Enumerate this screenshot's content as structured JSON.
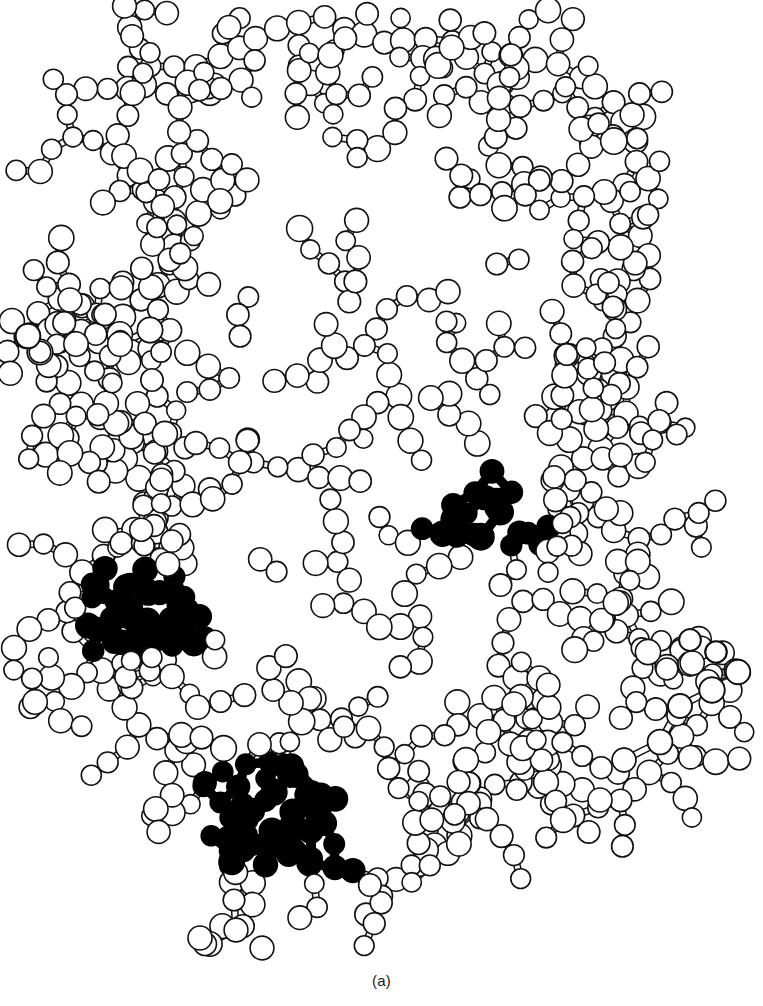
{
  "figure": {
    "caption": "(a)",
    "panel_label": "(a)",
    "background_color": "#ffffff",
    "line_color": "#111111",
    "open_atom_fill": "#ffffff",
    "highlighted_atom_fill": "#000000",
    "width": 763,
    "height": 1006
  },
  "chart_data": {
    "type": "diagram",
    "subtitle": "",
    "xlabel": "",
    "ylabel": "",
    "legend": [
      {
        "label": "Open (unhighlighted) atom",
        "fill": "#ffffff",
        "stroke": "#111111"
      },
      {
        "label": "Filled (highlighted) atom",
        "fill": "#000000",
        "stroke": "#000000"
      }
    ],
    "atom_radius_range": [
      9,
      15
    ],
    "bond_style": "double parallel line (tube)",
    "highlight_clusters": [
      {
        "name": "cluster-right-center",
        "bbox": [
          418,
          466,
          546,
          545
        ],
        "atom_count": 9
      },
      {
        "name": "cluster-left",
        "bbox": [
          88,
          572,
          204,
          652
        ],
        "atom_count": 11
      },
      {
        "name": "cluster-bottom-center",
        "bbox": [
          203,
          757,
          362,
          868
        ],
        "atom_count": 16
      }
    ],
    "open_atom_count_estimate": 430,
    "filled_atom_count_estimate": 36
  }
}
